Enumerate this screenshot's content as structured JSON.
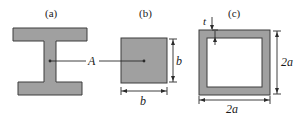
{
  "figure": {
    "title_visible": false,
    "colors": {
      "fill": "#a0a0a0",
      "outline": "#3d3d3d",
      "line": "#2b2b2b",
      "background": "#ffffff",
      "hole": "#ffffff"
    },
    "panels": [
      {
        "key": "a",
        "caption": "(a)",
        "shape": "i-beam-cross-section",
        "labels": [
          {
            "key": "area",
            "text": "A",
            "italic": true
          }
        ]
      },
      {
        "key": "b",
        "caption": "(b)",
        "shape": "solid-square-cross-section",
        "labels": [
          {
            "key": "width",
            "text": "b",
            "italic": true
          },
          {
            "key": "height",
            "text": "b",
            "italic": true
          }
        ]
      },
      {
        "key": "c",
        "caption": "(c)",
        "shape": "hollow-square-tube-cross-section",
        "labels": [
          {
            "key": "thickness",
            "text": "t",
            "italic": true
          },
          {
            "key": "width",
            "text": "2a",
            "italic": true
          },
          {
            "key": "height",
            "text": "2a",
            "italic": true
          }
        ]
      }
    ],
    "shared_label": {
      "key": "area",
      "text": "A"
    }
  }
}
